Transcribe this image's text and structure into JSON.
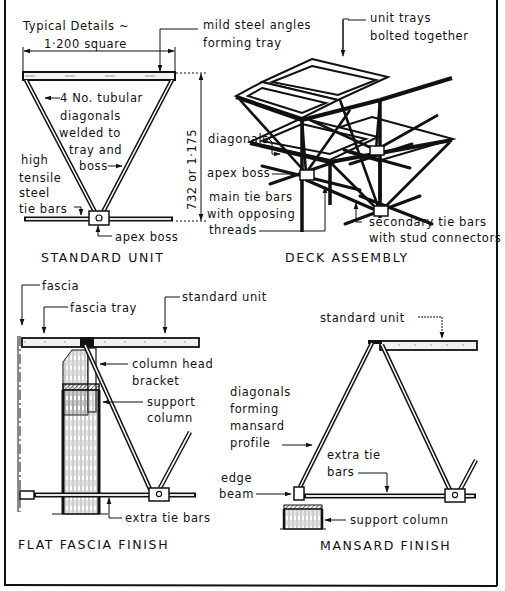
{
  "figure": {
    "frame_color": "#111111",
    "background": "#ffffff"
  },
  "standard_unit": {
    "caption": "STANDARD UNIT",
    "title_line1": "Typical Details ~",
    "title_line2": "1·200 square",
    "label_angles_line1": "mild steel angles",
    "label_angles_line2": "forming tray",
    "label_diagonals_line1": "4 No. tubular",
    "label_diagonals_line2": "diagonals",
    "label_diagonals_line3": "welded to",
    "label_diagonals_line4": "tray and",
    "label_diagonals_line5": "boss",
    "label_tiebars_line1": "high",
    "label_tiebars_line2": "tensile",
    "label_tiebars_line3": "steel",
    "label_tiebars_line4": "tie bars",
    "label_apex": "apex boss",
    "height_dimension": "732 or 1·175"
  },
  "deck_assembly": {
    "caption": "DECK ASSEMBLY",
    "label_trays_line1": "unit trays",
    "label_trays_line2": "bolted together",
    "label_diagonals": "diagonals",
    "label_apex": "apex boss",
    "label_main_tie_line1": "main tie bars",
    "label_main_tie_line2": "with opposing",
    "label_main_tie_line3": "threads",
    "label_secondary_line1": "secondary tie bars",
    "label_secondary_line2": "with stud connectors"
  },
  "flat_fascia": {
    "caption": "FLAT FASCIA FINISH",
    "label_fascia": "fascia",
    "label_fascia_tray": "fascia tray",
    "label_standard_unit": "standard unit",
    "label_bracket_line1": "column head",
    "label_bracket_line2": "bracket",
    "label_column_line1": "support",
    "label_column_line2": "column",
    "label_extra_tie": "extra tie bars"
  },
  "mansard": {
    "caption": "MANSARD FINISH",
    "label_standard_unit": "standard unit",
    "label_diagonals_line1": "diagonals",
    "label_diagonals_line2": "forming",
    "label_diagonals_line3": "mansard",
    "label_diagonals_line4": "profile",
    "label_extra_tie_line1": "extra tie",
    "label_extra_tie_line2": "bars",
    "label_edge_line1": "edge",
    "label_edge_line2": "beam",
    "label_support": "support column"
  }
}
